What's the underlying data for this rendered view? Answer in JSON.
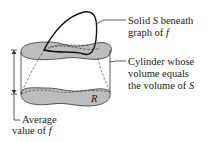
{
  "diagram": {
    "labels": {
      "solid_line1_pre": "Solid ",
      "solid_var": "S",
      "solid_line1_post": " beneath",
      "solid_line2_pre": "graph of ",
      "solid_line2_var": "f",
      "cyl_line1": "Cylinder whose",
      "cyl_line2": "volume equals",
      "cyl_line3_pre": "the volume of ",
      "cyl_line3_var": "S",
      "region": "R",
      "avg_line1": "Average",
      "avg_line2_pre": "value of ",
      "avg_line2_var": "f"
    },
    "colors": {
      "fill": "#bdbdbd",
      "stroke": "#1a1a1a"
    }
  }
}
